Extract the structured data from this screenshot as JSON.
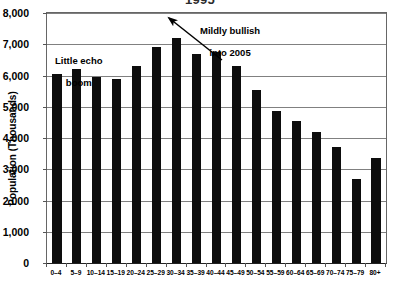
{
  "chart_data": {
    "type": "bar",
    "title": "1995",
    "xlabel": "",
    "ylabel": "Population (Thousands)",
    "ylim": [
      0,
      8000
    ],
    "ytick_labels": [
      "8,000",
      "7,000",
      "6,000",
      "5,000",
      "4,000",
      "3,000",
      "2,000",
      "1,000",
      "0"
    ],
    "ytick_values": [
      8000,
      7000,
      6000,
      5000,
      4000,
      3000,
      2000,
      1000,
      0
    ],
    "grid": true,
    "legend": "none",
    "bar_color": "#0d0d0d",
    "gridline_color": "#808080",
    "categories": [
      "0–4",
      "5–9",
      "10–14",
      "15–19",
      "20–24",
      "25–29",
      "30–34",
      "35–39",
      "40–44",
      "45–49",
      "50–54",
      "55–59",
      "60–64",
      "65–69",
      "70–74",
      "75–79",
      "80+"
    ],
    "values": [
      6050,
      6200,
      5950,
      5900,
      6300,
      6900,
      7200,
      6700,
      6750,
      6300,
      5550,
      4850,
      4550,
      4200,
      3700,
      2700,
      3350
    ],
    "annotations": [
      {
        "name": "little-echo-boom",
        "line1": "Little echo",
        "line2": "boom"
      },
      {
        "name": "mildly-bullish",
        "line1": "Mildly bullish",
        "line2": "into 2005",
        "arrow": "arrow pointing up-left toward tallest bar"
      }
    ]
  }
}
